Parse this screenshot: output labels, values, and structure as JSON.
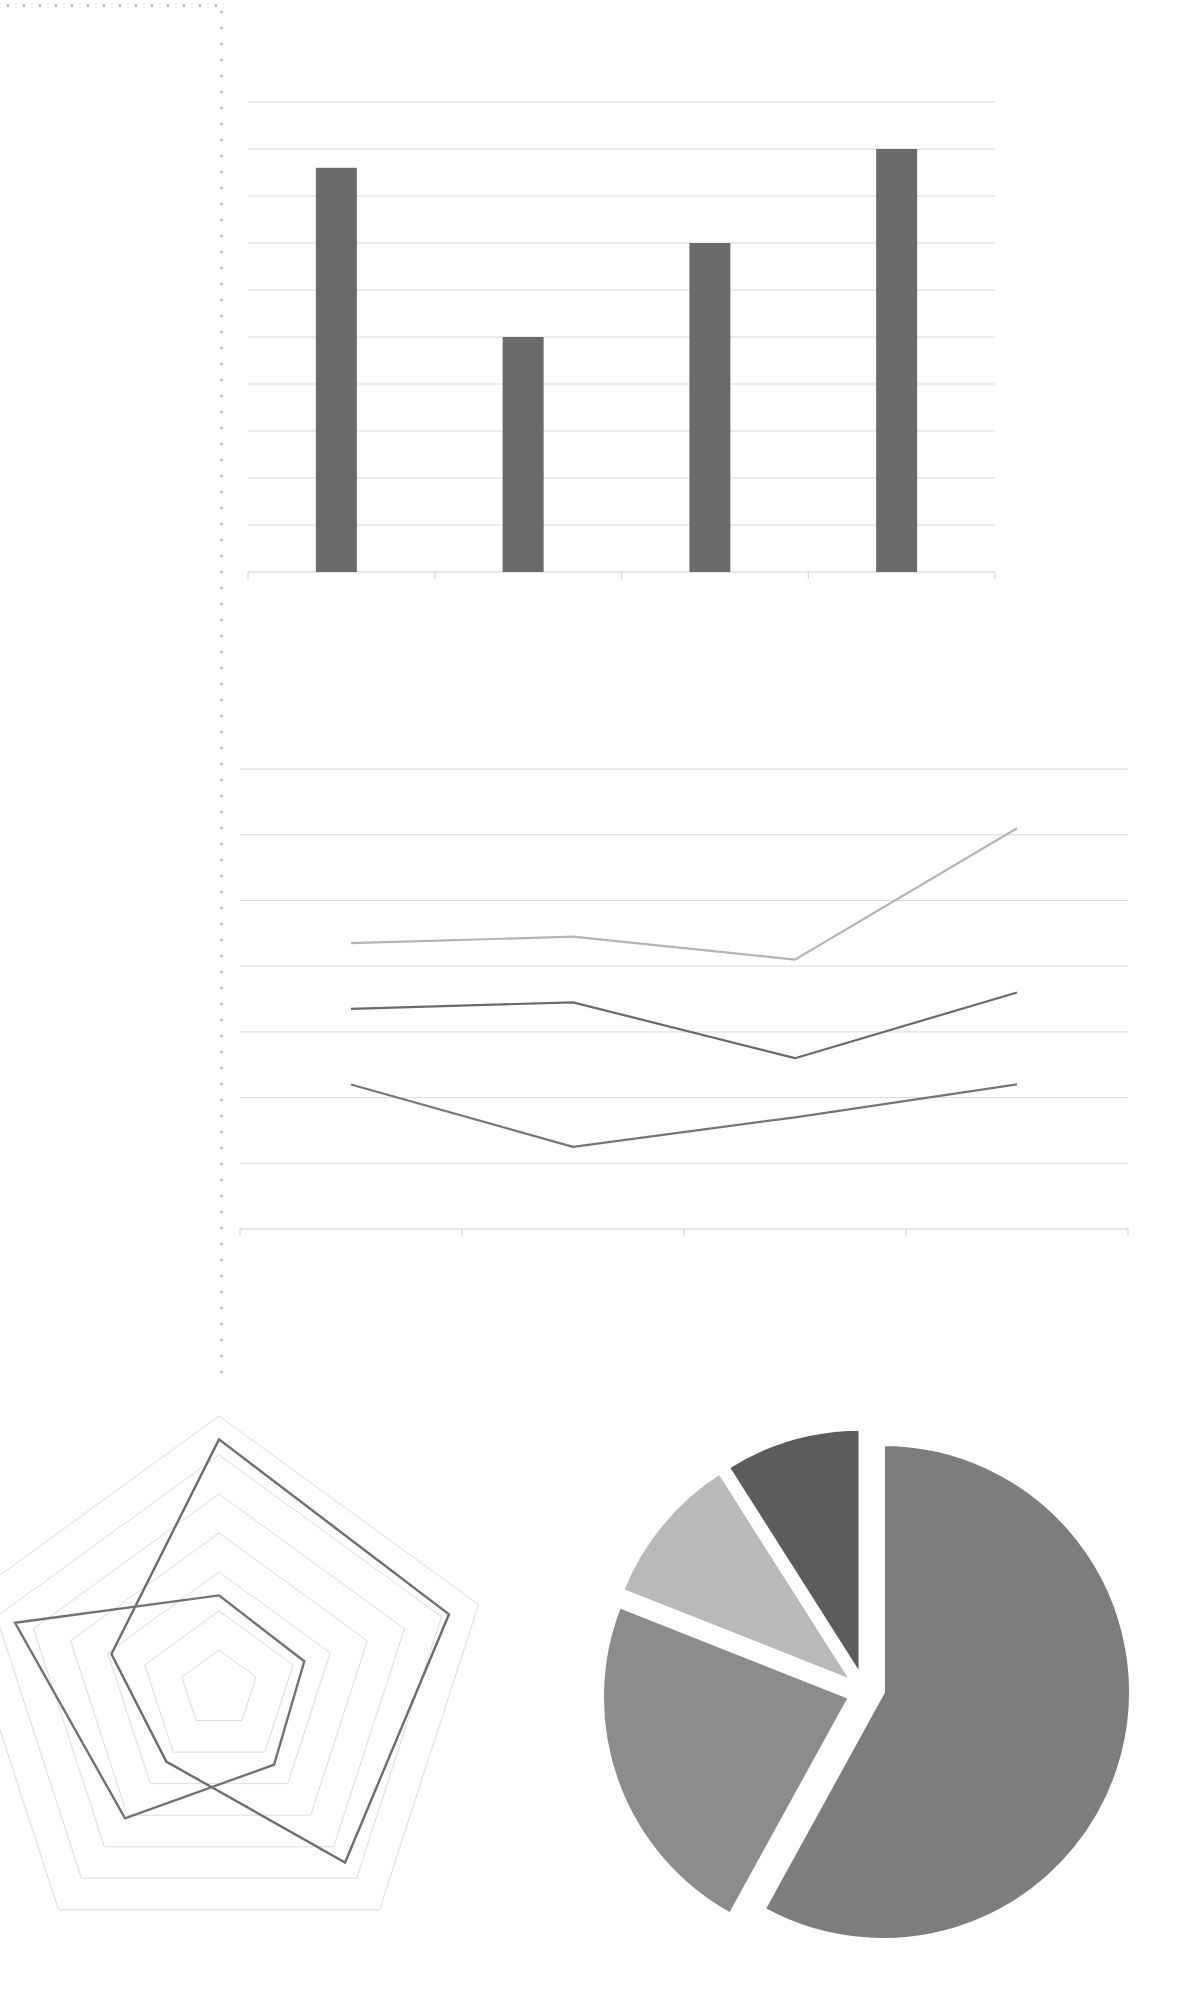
{
  "decor": {
    "frame_color": "#c4c4c4"
  },
  "chart_data": [
    {
      "type": "bar",
      "title": "",
      "xlabel": "",
      "ylabel": "",
      "categories": [
        "",
        "",
        "",
        ""
      ],
      "values": [
        8.6,
        5.0,
        7.0,
        9.0
      ],
      "ylim": [
        0,
        10
      ],
      "grid": true,
      "legend": null,
      "colors": {
        "bar": "#6b6b6b",
        "grid": "#d9d9d9",
        "axis": "#cfcfcf"
      },
      "layout": {
        "left": 248,
        "right": 995,
        "baseline": 572,
        "unit_px": 47,
        "bar_width": 41,
        "gridlines": 10
      }
    },
    {
      "type": "line",
      "title": "",
      "xlabel": "",
      "ylabel": "",
      "categories": [
        "",
        "",
        "",
        ""
      ],
      "series": [
        {
          "name": "",
          "values": [
            2.2,
            1.25,
            1.7,
            2.2
          ],
          "color": "#767676"
        },
        {
          "name": "",
          "values": [
            3.35,
            3.45,
            2.6,
            3.6
          ],
          "color": "#6a6a6a"
        },
        {
          "name": "",
          "values": [
            4.35,
            4.45,
            4.1,
            6.1
          ],
          "color": "#b4b4b4"
        }
      ],
      "ylim": [
        0,
        7
      ],
      "grid": true,
      "legend": null,
      "colors": {
        "grid": "#d9d9d9",
        "axis": "#cfcfcf"
      },
      "layout": {
        "left": 240,
        "right": 1128,
        "baseline": 1229,
        "unit_px": 65.7,
        "gridlines": 7
      }
    },
    {
      "type": "radar",
      "title": "",
      "axes": [
        "",
        "",
        "",
        "",
        ""
      ],
      "series": [
        {
          "name": "",
          "values": [
            6.4,
            6.2,
            5.5,
            2.3,
            2.9
          ],
          "color": "#6e6e6e"
        },
        {
          "name": "",
          "values": [
            2.4,
            2.3,
            2.4,
            4.1,
            5.5
          ],
          "color": "#727272"
        }
      ],
      "rmax": 7,
      "grid": true,
      "legend": null,
      "colors": {
        "grid": "#dcdcdc"
      },
      "layout": {
        "cx": 219,
        "cy": 1689,
        "ring_step_px": 39,
        "rings": 7
      }
    },
    {
      "type": "pie",
      "title": "",
      "labels": [
        "",
        "",
        "",
        ""
      ],
      "values": [
        58,
        23,
        10,
        9
      ],
      "colors": [
        "#7d7d7d",
        "#8c8c8c",
        "#b9b9b9",
        "#5c5c5c"
      ],
      "exploded": true,
      "legend": null,
      "layout": {
        "cx": 883,
        "cy": 1692,
        "r": 248,
        "explode_px": 16
      }
    }
  ]
}
